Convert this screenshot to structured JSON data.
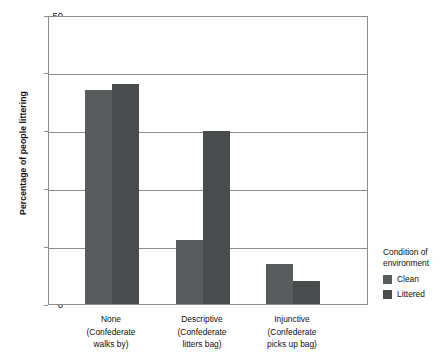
{
  "chart_data": {
    "type": "bar",
    "title": "",
    "xlabel": "",
    "ylabel": "Percentage of people littering",
    "ylim": [
      0,
      50
    ],
    "yticks": [
      0,
      10,
      20,
      30,
      40,
      50
    ],
    "grid": true,
    "legend_position": "right",
    "legend_title": "Condition of environment",
    "categories": [
      "None (Confederate walks by)",
      "Descriptive (Confederate litters bag)",
      "Injunctive (Confederate picks up bag)"
    ],
    "category_lines": [
      {
        "line1": "None",
        "line2": "(Confederate",
        "line3": "walks by)"
      },
      {
        "line1": "Descriptive",
        "line2": "(Confederate",
        "line3": "litters bag)"
      },
      {
        "line1": "Injunctive",
        "line2": "(Confederate",
        "line3": "picks up bag)"
      }
    ],
    "series": [
      {
        "name": "Clean",
        "color": "#585c5c",
        "values": [
          37,
          11,
          7
        ]
      },
      {
        "name": "Littered",
        "color": "#494c4c",
        "values": [
          38,
          30,
          4
        ]
      }
    ]
  },
  "axes": {
    "y_title": "Percentage of people littering",
    "y_tick_labels": [
      "50",
      "40",
      "30",
      "20",
      "10",
      "0"
    ]
  },
  "legend": {
    "title_line1": "Condition of",
    "title_line2": "environment",
    "items": [
      {
        "label": "Clean",
        "color": "#585c5c"
      },
      {
        "label": "Littered",
        "color": "#494c4c"
      }
    ]
  },
  "colors": {
    "clean": "#585c5c",
    "littered": "#494c4c",
    "axis": "#8d8d8d",
    "text": "#111111",
    "background": "#ffffff"
  }
}
